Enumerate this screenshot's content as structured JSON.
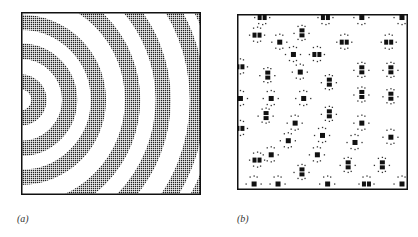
{
  "figure": {
    "panels": [
      {
        "id": "a",
        "label": "(a)",
        "description": "Dot-matrix pattern of concentric circular bands (alternating dark dotted and white rings) centered at left edge",
        "band_center": [
          0,
          0.48
        ],
        "band_radii": [
          0.1,
          0.27,
          0.43,
          0.62,
          0.79,
          0.98,
          1.12
        ],
        "band_width": 0.085
      },
      {
        "id": "b",
        "label": "(b)",
        "description": "Dot-matrix pattern of isolated black square clusters surrounded by small dots on white field",
        "clusters": [
          [
            0.15,
            0.02,
            "h"
          ],
          [
            0.52,
            0.02,
            "h"
          ],
          [
            0.73,
            0.02,
            "s"
          ],
          [
            0.98,
            0.02,
            "s"
          ],
          [
            0.12,
            0.12,
            "h"
          ],
          [
            0.38,
            0.11,
            "v"
          ],
          [
            0.63,
            0.16,
            "h"
          ],
          [
            0.89,
            0.16,
            "h"
          ],
          [
            0.25,
            0.16,
            "s"
          ],
          [
            0.33,
            0.23,
            "s"
          ],
          [
            0.47,
            0.23,
            "h"
          ],
          [
            0.02,
            0.3,
            "h"
          ],
          [
            0.18,
            0.35,
            "v"
          ],
          [
            0.37,
            0.33,
            "s"
          ],
          [
            0.54,
            0.39,
            "v"
          ],
          [
            0.73,
            0.32,
            "v"
          ],
          [
            0.9,
            0.32,
            "v"
          ],
          [
            0.02,
            0.48,
            "s"
          ],
          [
            0.2,
            0.48,
            "s"
          ],
          [
            0.39,
            0.48,
            "s"
          ],
          [
            0.73,
            0.46,
            "v"
          ],
          [
            0.9,
            0.47,
            "v"
          ],
          [
            0.54,
            0.57,
            "v"
          ],
          [
            0.17,
            0.58,
            "v"
          ],
          [
            0.34,
            0.62,
            "s"
          ],
          [
            0.73,
            0.62,
            "s"
          ],
          [
            0.02,
            0.65,
            "h"
          ],
          [
            0.3,
            0.72,
            "s"
          ],
          [
            0.5,
            0.69,
            "s"
          ],
          [
            0.69,
            0.73,
            "s"
          ],
          [
            0.9,
            0.7,
            "s"
          ],
          [
            0.2,
            0.8,
            "s"
          ],
          [
            0.47,
            0.8,
            "s"
          ],
          [
            0.12,
            0.83,
            "h"
          ],
          [
            0.38,
            0.9,
            "v"
          ],
          [
            0.65,
            0.86,
            "v"
          ],
          [
            0.85,
            0.86,
            "v"
          ],
          [
            0.1,
            0.98,
            "s"
          ],
          [
            0.24,
            0.98,
            "s"
          ],
          [
            0.53,
            0.98,
            "s"
          ],
          [
            0.76,
            0.98,
            "h"
          ],
          [
            0.99,
            0.98,
            "s"
          ]
        ]
      }
    ]
  }
}
